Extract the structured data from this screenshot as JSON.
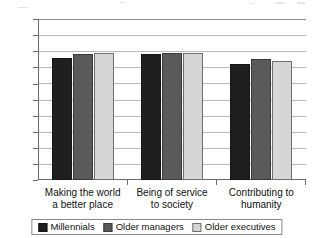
{
  "chart_data": {
    "type": "bar",
    "title": "",
    "subtitle": "",
    "xlabel": "",
    "ylabel": "",
    "categories": [
      "Making the world a better place",
      "Being of service to society",
      "Contributing to humanity"
    ],
    "category_lines": [
      [
        "Making the world",
        "a better place"
      ],
      [
        "Being of service",
        "to society"
      ],
      [
        "Contributing to",
        "humanity"
      ]
    ],
    "series": [
      {
        "name": "Millennials",
        "values": [
          76,
          78,
          72
        ],
        "color": "#1f1f1f"
      },
      {
        "name": "Older managers",
        "values": [
          78,
          79,
          75
        ],
        "color": "#5a5a5a"
      },
      {
        "name": "Older executives",
        "values": [
          79,
          79,
          74
        ],
        "color": "#d6d6d6"
      }
    ],
    "ylim": [
      0,
      100
    ],
    "ytick_values": [
      100,
      90,
      80,
      70,
      60,
      50,
      40,
      30,
      20,
      10,
      0
    ],
    "ytick_labels": [
      "100",
      "90",
      "80",
      "70",
      "60",
      "50",
      "40",
      "30",
      "20",
      "10",
      "0"
    ],
    "grid": true,
    "grid_axis": "y",
    "legend": true,
    "legend_position": "bottom",
    "orientation": "vertical",
    "bar_group_mode": "grouped"
  },
  "axis": {
    "y_line_color": "#6b6b6b",
    "gridline_color": "#b9b9b9"
  }
}
